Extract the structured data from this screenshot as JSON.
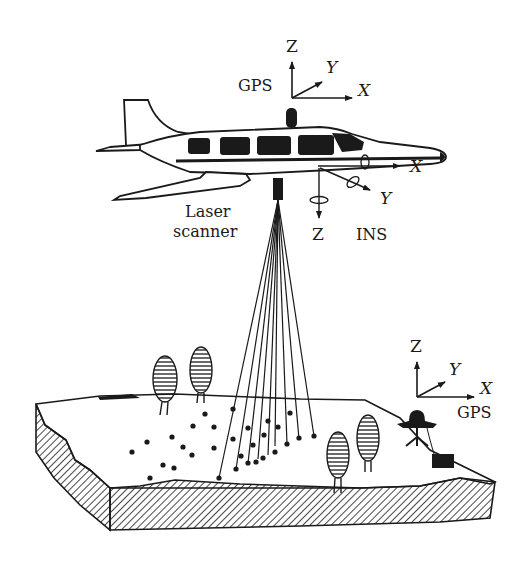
{
  "figure": {
    "labels": {
      "aircraft_gps": "GPS",
      "ground_gps": "GPS",
      "laser_scanner_line1": "Laser",
      "laser_scanner_line2": "scanner",
      "ins": "INS"
    },
    "axes": {
      "aircraft_gps": {
        "x": "X",
        "y": "Y",
        "z": "Z"
      },
      "ins": {
        "x": "X",
        "y": "Y",
        "z": "Z"
      },
      "ground_gps": {
        "x": "X",
        "y": "Y",
        "z": "Z"
      }
    },
    "colors": {
      "ink": "#1a1a1a",
      "background": "#ffffff"
    }
  }
}
